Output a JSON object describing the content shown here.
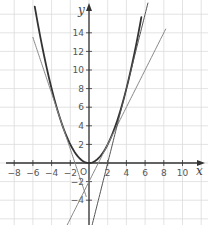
{
  "chart_data": {
    "type": "line",
    "title": "",
    "xlabel": "x",
    "ylabel": "y",
    "xlim": [
      -9.5,
      11.5
    ],
    "ylim": [
      -6.8,
      17.5
    ],
    "grid": true,
    "grid_step": 2,
    "legend": null,
    "x_ticks": [
      -8,
      -6,
      -4,
      -2,
      2,
      4,
      6,
      8,
      10
    ],
    "x_tick_labels": [
      "−8",
      "−6",
      "−4",
      "−2",
      "2",
      "4",
      "6",
      "8",
      "10"
    ],
    "y_ticks": [
      14,
      12,
      10,
      8,
      6,
      4,
      2,
      -2,
      -4
    ],
    "y_tick_labels": [
      "14",
      "12",
      "10",
      "8",
      "6",
      "4",
      "2",
      "−2",
      "−4"
    ],
    "origin_label": "O",
    "series": [
      {
        "name": "parabola",
        "expression": "y = x^2 / 2",
        "x_range": [
          -5.8,
          5.6
        ],
        "color": "#333333",
        "width": 1.8
      },
      {
        "name": "tangent at x=-3",
        "expression": "y = -3x - 4.5",
        "x_range": [
          -6,
          -0.3
        ],
        "color": "#888888",
        "width": 1
      },
      {
        "name": "tangent at x=2",
        "expression": "y = 2x - 2",
        "x_range": [
          -2.9,
          8.2
        ],
        "color": "#888888",
        "width": 1
      },
      {
        "name": "tangent at x=4",
        "expression": "y = 4x - 8",
        "x_range": [
          0.15,
          6.3
        ],
        "color": "#555555",
        "width": 1
      }
    ]
  },
  "labels": {
    "x_axis": "x",
    "y_axis": "y",
    "origin": "O"
  }
}
